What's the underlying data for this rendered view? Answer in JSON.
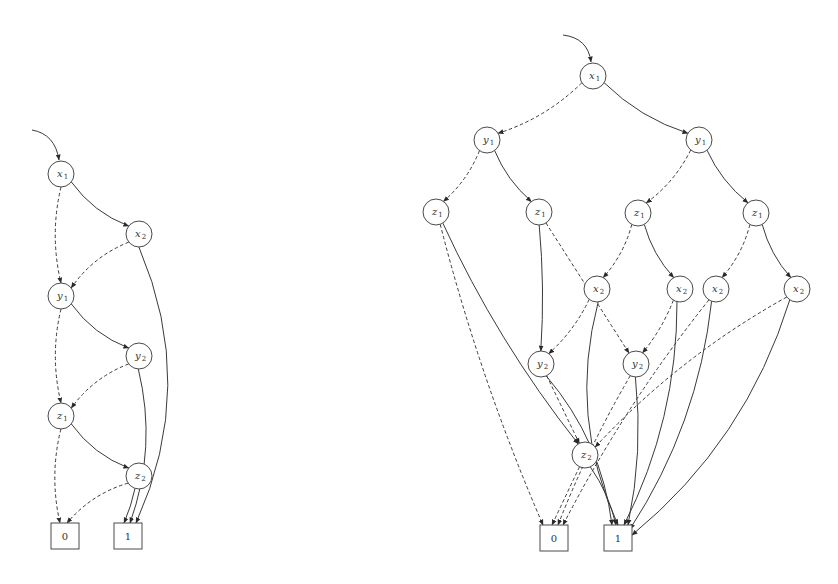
{
  "colors": {
    "stroke": "#3a3a3a",
    "node_fill": "#ffffff",
    "background": "#ffffff"
  },
  "legend": {
    "solid": "high (1) edge",
    "dashed": "low (0) edge"
  },
  "diagrams": [
    {
      "id": "left-bdd",
      "entry": {
        "from": [
          32,
          130
        ],
        "ctrl": [
          55,
          134
        ],
        "to": [
          59,
          160
        ]
      },
      "nodes": [
        {
          "id": "L_x1",
          "var": "x",
          "sub": "1",
          "x": 61,
          "y": 174
        },
        {
          "id": "L_x2",
          "var": "x",
          "sub": "2",
          "x": 139,
          "y": 234
        },
        {
          "id": "L_y1",
          "var": "y",
          "sub": "1",
          "x": 61,
          "y": 296
        },
        {
          "id": "L_y2",
          "var": "y",
          "sub": "2",
          "x": 139,
          "y": 356
        },
        {
          "id": "L_z1",
          "var": "z",
          "sub": "1",
          "x": 61,
          "y": 416
        },
        {
          "id": "L_z2",
          "var": "z",
          "sub": "2",
          "x": 139,
          "y": 476
        }
      ],
      "terminals": [
        {
          "id": "L_0",
          "label": "0",
          "x": 51,
          "y": 523,
          "w": 28,
          "h": 26
        },
        {
          "id": "L_1",
          "label": "1",
          "x": 114,
          "y": 523,
          "w": 28,
          "h": 26
        }
      ],
      "edges": [
        {
          "from": "L_x1",
          "to": "L_x2",
          "type": "solid",
          "bend": 0.15
        },
        {
          "from": "L_x1",
          "to": "L_y1",
          "type": "dashed",
          "bend": 0.12
        },
        {
          "from": "L_x2",
          "to": "L_y1",
          "type": "dashed",
          "bend": 0.15
        },
        {
          "from": "L_x2",
          "to": "L_1",
          "type": "solid",
          "bend": -0.22,
          "tx": 136
        },
        {
          "from": "L_y1",
          "to": "L_y2",
          "type": "solid",
          "bend": 0.15
        },
        {
          "from": "L_y1",
          "to": "L_z1",
          "type": "dashed",
          "bend": 0.12
        },
        {
          "from": "L_y2",
          "to": "L_z1",
          "type": "dashed",
          "bend": 0.15
        },
        {
          "from": "L_y2",
          "to": "L_1",
          "type": "solid",
          "bend": -0.15,
          "tx": 130
        },
        {
          "from": "L_z1",
          "to": "L_z2",
          "type": "solid",
          "bend": 0.15
        },
        {
          "from": "L_z1",
          "to": "L_0",
          "type": "dashed",
          "bend": 0.12,
          "tx": 60
        },
        {
          "from": "L_z2",
          "to": "L_0",
          "type": "dashed",
          "bend": 0.15,
          "tx": 67
        },
        {
          "from": "L_z2",
          "to": "L_1",
          "type": "solid",
          "bend": -0.05,
          "tx": 124
        }
      ]
    },
    {
      "id": "right-bdd",
      "entry": {
        "from": [
          563,
          35
        ],
        "ctrl": [
          588,
          38
        ],
        "to": [
          591,
          62
        ]
      },
      "nodes": [
        {
          "id": "R_x1",
          "var": "x",
          "sub": "1",
          "x": 593,
          "y": 76
        },
        {
          "id": "R_y1a",
          "var": "y",
          "sub": "1",
          "x": 487,
          "y": 140
        },
        {
          "id": "R_y1b",
          "var": "y",
          "sub": "1",
          "x": 699,
          "y": 140
        },
        {
          "id": "R_z1a",
          "var": "z",
          "sub": "1",
          "x": 436,
          "y": 212
        },
        {
          "id": "R_z1b",
          "var": "z",
          "sub": "1",
          "x": 539,
          "y": 212
        },
        {
          "id": "R_z1c",
          "var": "z",
          "sub": "1",
          "x": 638,
          "y": 213
        },
        {
          "id": "R_z1d",
          "var": "z",
          "sub": "1",
          "x": 756,
          "y": 213
        },
        {
          "id": "R_x2a",
          "var": "x",
          "sub": "2",
          "x": 597,
          "y": 289
        },
        {
          "id": "R_x2b",
          "var": "x",
          "sub": "2",
          "x": 680,
          "y": 289
        },
        {
          "id": "R_x2c",
          "var": "x",
          "sub": "2",
          "x": 716,
          "y": 289
        },
        {
          "id": "R_x2d",
          "var": "x",
          "sub": "2",
          "x": 797,
          "y": 289
        },
        {
          "id": "R_y2a",
          "var": "y",
          "sub": "2",
          "x": 541,
          "y": 364
        },
        {
          "id": "R_y2b",
          "var": "y",
          "sub": "2",
          "x": 636,
          "y": 364
        },
        {
          "id": "R_z2",
          "var": "z",
          "sub": "2",
          "x": 585,
          "y": 455
        }
      ],
      "terminals": [
        {
          "id": "R_0",
          "label": "0",
          "x": 540,
          "y": 525,
          "w": 28,
          "h": 26
        },
        {
          "id": "R_1",
          "label": "1",
          "x": 604,
          "y": 525,
          "w": 28,
          "h": 26
        }
      ],
      "edges": [
        {
          "from": "R_x1",
          "to": "R_y1a",
          "type": "dashed",
          "bend": -0.12
        },
        {
          "from": "R_x1",
          "to": "R_y1b",
          "type": "solid",
          "bend": 0.12
        },
        {
          "from": "R_y1a",
          "to": "R_z1a",
          "type": "dashed",
          "bend": -0.12
        },
        {
          "from": "R_y1a",
          "to": "R_z1b",
          "type": "solid",
          "bend": 0.12
        },
        {
          "from": "R_y1b",
          "to": "R_z1c",
          "type": "dashed",
          "bend": -0.12
        },
        {
          "from": "R_y1b",
          "to": "R_z1d",
          "type": "solid",
          "bend": 0.12
        },
        {
          "from": "R_z1a",
          "to": "R_0",
          "type": "dashed",
          "bend": 0.04,
          "tx": 543
        },
        {
          "from": "R_z1a",
          "to": "R_z2",
          "type": "solid",
          "bend": 0.06
        },
        {
          "from": "R_z1b",
          "to": "R_y2a",
          "type": "solid",
          "bend": -0.04
        },
        {
          "from": "R_z1b",
          "to": "R_y2b",
          "type": "dashed",
          "bend": 0.0
        },
        {
          "from": "R_z1c",
          "to": "R_x2a",
          "type": "dashed",
          "bend": -0.12
        },
        {
          "from": "R_z1c",
          "to": "R_x2b",
          "type": "solid",
          "bend": 0.12
        },
        {
          "from": "R_z1d",
          "to": "R_x2c",
          "type": "dashed",
          "bend": -0.12
        },
        {
          "from": "R_z1d",
          "to": "R_x2d",
          "type": "solid",
          "bend": 0.12
        },
        {
          "from": "R_x2a",
          "to": "R_y2a",
          "type": "dashed",
          "bend": -0.1
        },
        {
          "from": "R_x2a",
          "to": "R_1",
          "type": "solid",
          "bend": 0.18,
          "tx": 618
        },
        {
          "from": "R_x2b",
          "to": "R_y2b",
          "type": "dashed",
          "bend": -0.08
        },
        {
          "from": "R_x2b",
          "to": "R_1",
          "type": "solid",
          "bend": -0.12,
          "tx": 624
        },
        {
          "from": "R_x2c",
          "to": "R_0",
          "type": "dashed",
          "bend": 0.05,
          "tx": 563
        },
        {
          "from": "R_x2c",
          "to": "R_1",
          "type": "solid",
          "bend": -0.12,
          "tx": 630,
          "ty": 4
        },
        {
          "from": "R_x2d",
          "to": "R_z2",
          "type": "dashed",
          "bend": 0.08
        },
        {
          "from": "R_x2d",
          "to": "R_1",
          "type": "solid",
          "bend": -0.15,
          "tx": 632,
          "ty": 10
        },
        {
          "from": "R_y2a",
          "to": "R_z2",
          "type": "dashed",
          "bend": 0.0
        },
        {
          "from": "R_y2a",
          "to": "R_1",
          "type": "solid",
          "bend": -0.15,
          "tx": 612
        },
        {
          "from": "R_y2b",
          "to": "R_0",
          "type": "dashed",
          "bend": 0.04,
          "tx": 558
        },
        {
          "from": "R_y2b",
          "to": "R_1",
          "type": "solid",
          "bend": -0.08,
          "tx": 628,
          "ty": 0
        },
        {
          "from": "R_z2",
          "to": "R_0",
          "type": "dashed",
          "bend": 0.0,
          "tx": 552
        },
        {
          "from": "R_z2",
          "to": "R_1",
          "type": "solid",
          "bend": -0.1,
          "tx": 616
        }
      ]
    }
  ]
}
